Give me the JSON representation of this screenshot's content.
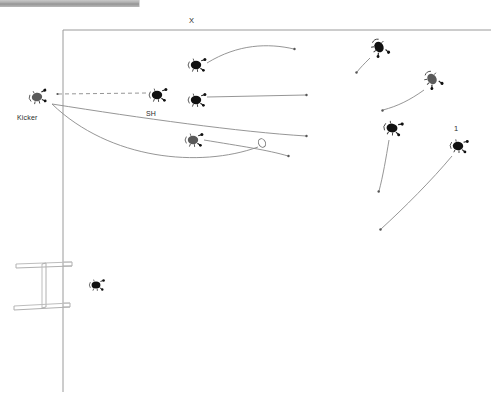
{
  "window": {
    "titlebar_present": true,
    "titlebar_color": "#a7a7a7"
  },
  "diagram": {
    "kind": "rugby-kick-play-diagram",
    "background_color": "#ffffff",
    "line_color": "#808080",
    "player_color": "#111111",
    "labels": [
      {
        "id": "x-label",
        "text": "X",
        "x": 192,
        "y": 21
      },
      {
        "id": "sh-label",
        "text": "SH",
        "x": 151,
        "y": 115
      },
      {
        "id": "kicker-label",
        "text": "Kicker",
        "x": 32,
        "y": 119
      },
      {
        "id": "one-label",
        "text": "1",
        "x": 457,
        "y": 129
      }
    ],
    "field": {
      "top_line": {
        "x1": 63,
        "y1": 30,
        "x2": 490,
        "y2": 30
      },
      "left_line": {
        "x1": 63,
        "y1": 30,
        "x2": 63,
        "y2": 392
      }
    },
    "goal_posts": {
      "description": "perspective goal posts at lower left",
      "crossbar_y": 268,
      "base_y": 310
    },
    "ball": {
      "x": 262,
      "y": 143,
      "rx": 3.6,
      "ry": 4.6
    },
    "players": [
      {
        "id": "kicker",
        "x": 37,
        "y": 97,
        "rot": -8,
        "shade": "dark-gray",
        "label": "Kicker"
      },
      {
        "id": "sh",
        "x": 157,
        "y": 95,
        "rot": 0,
        "shade": "black",
        "label": "SH"
      },
      {
        "id": "p-top",
        "x": 196,
        "y": 65,
        "rot": 0,
        "shade": "black",
        "label": ""
      },
      {
        "id": "p-mid",
        "x": 196,
        "y": 100,
        "rot": 0,
        "shade": "black",
        "label": ""
      },
      {
        "id": "p-low",
        "x": 193,
        "y": 140,
        "rot": 0,
        "shade": "gray",
        "label": ""
      },
      {
        "id": "p-ur1",
        "x": 379,
        "y": 47,
        "rot": 30,
        "shade": "black",
        "label": ""
      },
      {
        "id": "p-ur2",
        "x": 432,
        "y": 79,
        "rot": 40,
        "shade": "gray",
        "label": ""
      },
      {
        "id": "p-mr",
        "x": 392,
        "y": 128,
        "rot": 15,
        "shade": "black",
        "label": ""
      },
      {
        "id": "p-r1",
        "x": 458,
        "y": 145,
        "rot": 10,
        "shade": "black",
        "label": "1"
      },
      {
        "id": "p-goal",
        "x": 96,
        "y": 285,
        "rot": 0,
        "shade": "black",
        "label": ""
      }
    ],
    "paths": [
      {
        "id": "dashed-kick-line",
        "style": "dashed",
        "from": "kicker",
        "to": "sh"
      },
      {
        "id": "kick-flight-1",
        "style": "curve",
        "desc": "long flat curve from kicker to right"
      },
      {
        "id": "kick-flight-2",
        "style": "curve",
        "desc": "deep arc from kicker dipping low then to ball"
      },
      {
        "id": "run-top",
        "style": "curve",
        "desc": "arc from p-top curving right and up"
      },
      {
        "id": "run-mid",
        "style": "straight",
        "desc": "straight line from p-mid to right"
      },
      {
        "id": "run-low",
        "style": "curve",
        "desc": "arc from p-low to lower right"
      },
      {
        "id": "run-ur1",
        "style": "curve",
        "desc": "arc up into p-ur1"
      },
      {
        "id": "run-ur2",
        "style": "curve",
        "desc": "arc up into p-ur2"
      },
      {
        "id": "run-mr",
        "style": "straight",
        "desc": "line up into p-mr"
      },
      {
        "id": "run-r1",
        "style": "curve",
        "desc": "long arc up into p-r1"
      }
    ]
  }
}
